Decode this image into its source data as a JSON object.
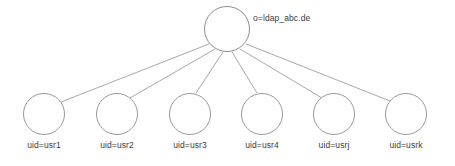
{
  "diagram": {
    "type": "tree",
    "canvas": {
      "width": 455,
      "height": 166,
      "background": "#ffffff"
    },
    "style": {
      "edge_color": "#a8a8a8",
      "node_stroke": "#999999",
      "node_fill": "#ffffff",
      "label_color": "#3b3b3b"
    },
    "root": {
      "id": "root",
      "label": "o=ldap_abc.de",
      "cx": 227,
      "cy": 29,
      "r": 23,
      "label_x": 253,
      "label_y": 13
    },
    "leaves": [
      {
        "id": "leaf1",
        "label": "uid=usr1",
        "cx": 44,
        "cy": 114,
        "r": 21,
        "label_y": 140
      },
      {
        "id": "leaf2",
        "label": "uid=usr2",
        "cx": 117,
        "cy": 114,
        "r": 21,
        "label_y": 140
      },
      {
        "id": "leaf3",
        "label": "uid=usr3",
        "cx": 190,
        "cy": 114,
        "r": 21,
        "label_y": 140
      },
      {
        "id": "leaf4",
        "label": "uid=usr4",
        "cx": 262,
        "cy": 114,
        "r": 21,
        "label_y": 140
      },
      {
        "id": "leaf5",
        "label": "uid=usrj",
        "cx": 334,
        "cy": 114,
        "r": 21,
        "label_y": 140
      },
      {
        "id": "leaf6",
        "label": "uid=usrk",
        "cx": 406,
        "cy": 114,
        "r": 21,
        "label_y": 140
      }
    ],
    "edges": [
      {
        "from": "root",
        "to": "leaf1",
        "x1": 209,
        "y1": 44,
        "x2": 61,
        "y2": 102
      },
      {
        "from": "root",
        "to": "leaf2",
        "x1": 215,
        "y1": 49,
        "x2": 130,
        "y2": 98
      },
      {
        "from": "root",
        "to": "leaf3",
        "x1": 223,
        "y1": 52,
        "x2": 196,
        "y2": 93
      },
      {
        "from": "root",
        "to": "leaf4",
        "x1": 232,
        "y1": 52,
        "x2": 257,
        "y2": 93
      },
      {
        "from": "root",
        "to": "leaf5",
        "x1": 240,
        "y1": 49,
        "x2": 322,
        "y2": 98
      },
      {
        "from": "root",
        "to": "leaf6",
        "x1": 246,
        "y1": 44,
        "x2": 390,
        "y2": 101
      }
    ]
  }
}
